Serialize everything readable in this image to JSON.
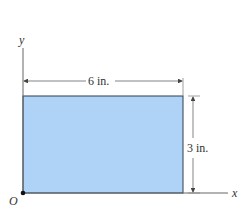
{
  "diagram": {
    "axes": {
      "x_label": "x",
      "y_label": "y",
      "origin_label": "O"
    },
    "rectangle": {
      "width_label": "6 in.",
      "height_label": "3 in.",
      "fill": "#aed3f6",
      "stroke": "#2c3e50"
    },
    "colors": {
      "line": "#555555",
      "text": "#333333"
    }
  }
}
